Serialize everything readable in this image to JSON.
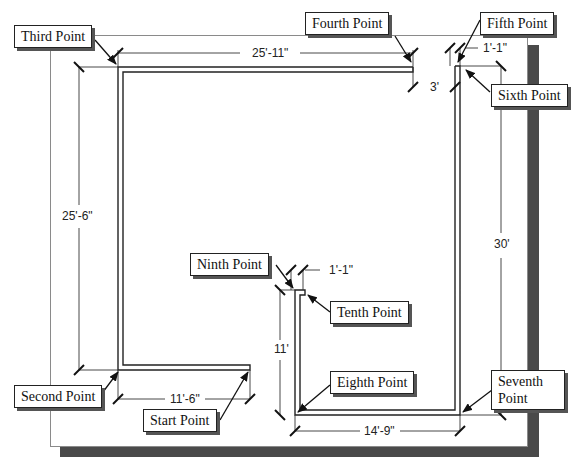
{
  "diagram": {
    "type": "floor-plan-wall-outline",
    "callouts": [
      {
        "id": "third",
        "label": "Third Point"
      },
      {
        "id": "fourth",
        "label": "Fourth Point"
      },
      {
        "id": "fifth",
        "label": "Fifth Point"
      },
      {
        "id": "sixth",
        "label": "Sixth Point"
      },
      {
        "id": "second",
        "label": "Second Point"
      },
      {
        "id": "start",
        "label": "Start Point"
      },
      {
        "id": "ninth",
        "label": "Ninth Point"
      },
      {
        "id": "tenth",
        "label": "Tenth Point"
      },
      {
        "id": "eighth",
        "label": "Eighth Point"
      },
      {
        "id": "seventh",
        "label": "Seventh Point"
      }
    ],
    "dimensions": {
      "top_span": "25'-11\"",
      "left_height": "25'-6\"",
      "bottom_left": "11'-6\"",
      "right_height": "30'",
      "bottom_right": "14'-9\"",
      "gap_top": "3'",
      "fifth_offset": "1'-1\"",
      "ninth_offset": "1'-1\"",
      "inner_height": "11'"
    },
    "colors": {
      "line": "#222222",
      "shadow": "#4a4a4a",
      "paper_border": "#8a8a8a"
    }
  }
}
